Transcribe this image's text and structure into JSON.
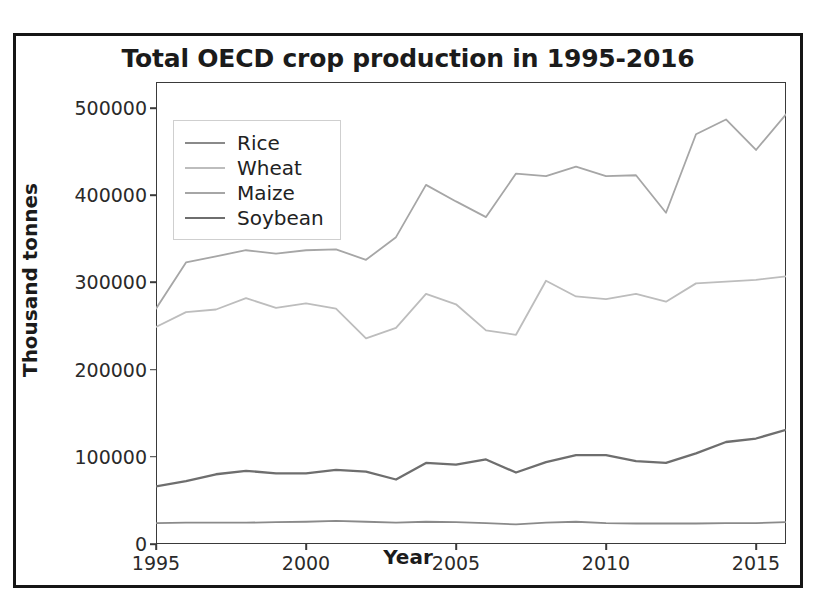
{
  "figure": {
    "title": "Total OECD crop production in 1995-2016",
    "xlabel": "Year",
    "ylabel": "Thousand tonnes"
  },
  "legend": {
    "position": "upper-left",
    "entries": [
      {
        "label": "Rice",
        "color": "#8a8a8a"
      },
      {
        "label": "Wheat",
        "color": "#bdbdbd"
      },
      {
        "label": "Maize",
        "color": "#a6a6a6"
      },
      {
        "label": "Soybean",
        "color": "#6e6e6e"
      }
    ]
  },
  "axes": {
    "ytick_labels": [
      "0",
      "100000",
      "200000",
      "300000",
      "400000",
      "500000"
    ],
    "ytick_values": [
      0,
      100000,
      200000,
      300000,
      400000,
      500000
    ],
    "xtick_labels": [
      "1995",
      "2000",
      "2005",
      "2010",
      "2015"
    ],
    "xtick_values": [
      1995,
      2000,
      2005,
      2010,
      2015
    ]
  },
  "chart_data": {
    "type": "line",
    "title": "Total OECD crop production in 1995-2016",
    "xlabel": "Year",
    "ylabel": "Thousand tonnes",
    "xlim": [
      1995,
      2016
    ],
    "ylim": [
      0,
      530000
    ],
    "grid": false,
    "legend_position": "upper left",
    "x": [
      1995,
      1996,
      1997,
      1998,
      1999,
      2000,
      2001,
      2002,
      2003,
      2004,
      2005,
      2006,
      2007,
      2008,
      2009,
      2010,
      2011,
      2012,
      2013,
      2014,
      2015,
      2016
    ],
    "series": [
      {
        "name": "Rice",
        "color": "#8a8a8a",
        "values": [
          24000,
          24500,
          24500,
          24500,
          25000,
          25500,
          26500,
          25500,
          24500,
          25500,
          25000,
          24000,
          22500,
          24500,
          25500,
          24000,
          23500,
          23500,
          23500,
          24000,
          24000,
          25000
        ]
      },
      {
        "name": "Wheat",
        "color": "#bdbdbd",
        "values": [
          249000,
          266000,
          269000,
          282000,
          271000,
          276000,
          270000,
          236000,
          248000,
          287000,
          275000,
          245000,
          240000,
          302000,
          284000,
          281000,
          287000,
          278000,
          299000,
          301000,
          303000,
          307000
        ]
      },
      {
        "name": "Maize",
        "color": "#a6a6a6",
        "values": [
          270000,
          323000,
          330000,
          337000,
          333000,
          337000,
          338000,
          326000,
          352000,
          412000,
          393000,
          375000,
          425000,
          422000,
          433000,
          422000,
          423000,
          380000,
          470000,
          487000,
          452000,
          493000
        ]
      },
      {
        "name": "Soybean",
        "color": "#6e6e6e",
        "values": [
          66000,
          72000,
          80000,
          84000,
          81000,
          81000,
          85000,
          83000,
          74000,
          93000,
          91000,
          97000,
          82000,
          94000,
          102000,
          102000,
          95000,
          93000,
          104000,
          117000,
          121000,
          131000
        ]
      }
    ]
  }
}
